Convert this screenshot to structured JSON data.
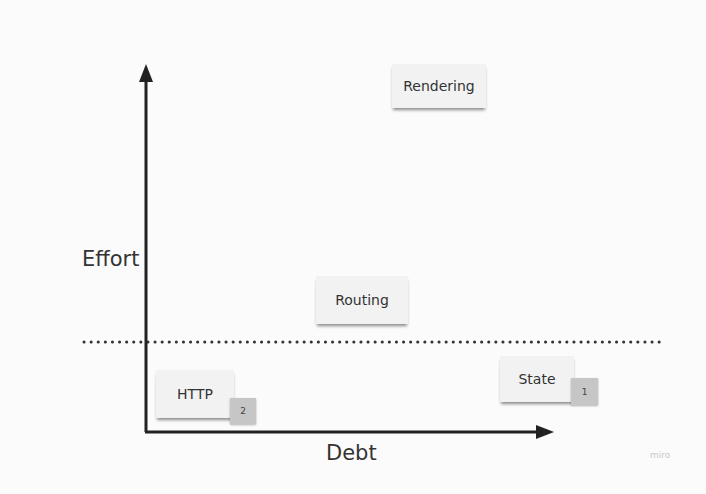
{
  "diagram": {
    "axes": {
      "y_label": "Effort",
      "x_label": "Debt"
    },
    "threshold_line": "dotted",
    "cards": [
      {
        "label": "Rendering",
        "badge": null
      },
      {
        "label": "Routing",
        "badge": null
      },
      {
        "label": "HTTP",
        "badge": "2"
      },
      {
        "label": "State",
        "badge": "1"
      }
    ],
    "watermark": "miro",
    "colors": {
      "background": "#fbfbfb",
      "card": "#f2f2f2",
      "badge": "#c6c6c6",
      "axis": "#222222",
      "text": "#333333"
    }
  }
}
